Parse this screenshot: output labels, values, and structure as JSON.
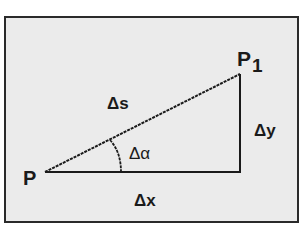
{
  "diagram": {
    "type": "right-triangle",
    "colors": {
      "page_background": "#ffffff",
      "frame_background": "#ebebeb",
      "frame_border": "#2a2a2a",
      "stroke": "#1a1a1a"
    },
    "points": {
      "start": {
        "label": "P",
        "x": 45,
        "y": 172
      },
      "end": {
        "label": "P",
        "subscript": "1",
        "x": 240,
        "y": 74
      },
      "corner": {
        "x": 240,
        "y": 172
      }
    },
    "labels": {
      "hypotenuse": "Δs",
      "vertical_leg": "Δy",
      "horizontal_leg": "Δx",
      "angle": "Δα"
    }
  }
}
